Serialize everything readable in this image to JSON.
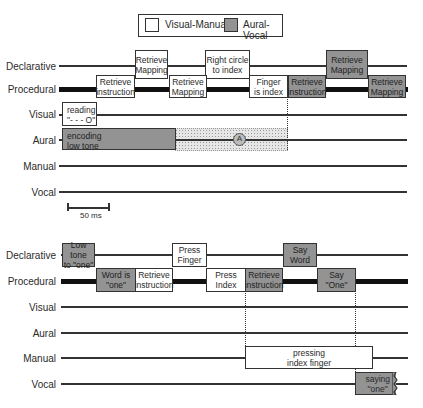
{
  "legend": {
    "items": [
      {
        "label": "Visual-Manual",
        "color": "#ffffff"
      },
      {
        "label": "Aural-Vocal",
        "color": "#939393"
      }
    ]
  },
  "colors": {
    "visual_manual": "#ffffff",
    "aural_vocal": "#939393",
    "line": "#333333"
  },
  "top_panel": {
    "rows": {
      "declarative": "Declarative",
      "procedural": "Procedural",
      "visual": "Visual",
      "aural": "Aural",
      "manual": "Manual",
      "vocal": "Vocal"
    },
    "declarative_boxes": [
      {
        "label": "Retrieve\nMapping",
        "type": "visual-manual"
      },
      {
        "label": "Right circle\nto index",
        "type": "visual-manual"
      },
      {
        "label": "Retrieve\nMapping",
        "type": "aural-vocal"
      }
    ],
    "procedural_boxes": [
      {
        "label": "Retrieve\ninstruction",
        "type": "visual-manual"
      },
      {
        "label": "Retrieve\nMapping",
        "type": "visual-manual"
      },
      {
        "label": "Finger\nis index",
        "type": "visual-manual"
      },
      {
        "label": "Retrieve\ninstruction",
        "type": "aural-vocal"
      },
      {
        "label": "Retrieve\nMapping",
        "type": "aural-vocal"
      }
    ],
    "visual_boxes": [
      {
        "label": "reading\n\"- - - O\"",
        "type": "visual-manual"
      }
    ],
    "aural_boxes": [
      {
        "label": "encoding\nlow tone",
        "type": "aural-vocal"
      }
    ],
    "interference_marker": "A",
    "scale_bar": {
      "label": "50 ms"
    }
  },
  "bottom_panel": {
    "rows": {
      "declarative": "Declarative",
      "procedural": "Procedural",
      "visual": "Visual",
      "aural": "Aural",
      "manual": "Manual",
      "vocal": "Vocal"
    },
    "declarative_boxes": [
      {
        "label": "Low tone\nto \"one\"",
        "type": "aural-vocal"
      },
      {
        "label": "Press\nFinger",
        "type": "visual-manual"
      },
      {
        "label": "Say\nWord",
        "type": "aural-vocal"
      }
    ],
    "procedural_boxes": [
      {
        "label": "Word is\n\"one\"",
        "type": "aural-vocal"
      },
      {
        "label": "Retrieve\ninstruction",
        "type": "visual-manual"
      },
      {
        "label": "Press\nIndex",
        "type": "visual-manual"
      },
      {
        "label": "Retrieve\ninstruction",
        "type": "aural-vocal"
      },
      {
        "label": "Say\n\"One\"",
        "type": "aural-vocal"
      }
    ],
    "manual_boxes": [
      {
        "label": "pressing\nindex finger",
        "type": "visual-manual"
      }
    ],
    "vocal_boxes": [
      {
        "label": "saying\n\"one\"",
        "type": "aural-vocal"
      }
    ]
  }
}
